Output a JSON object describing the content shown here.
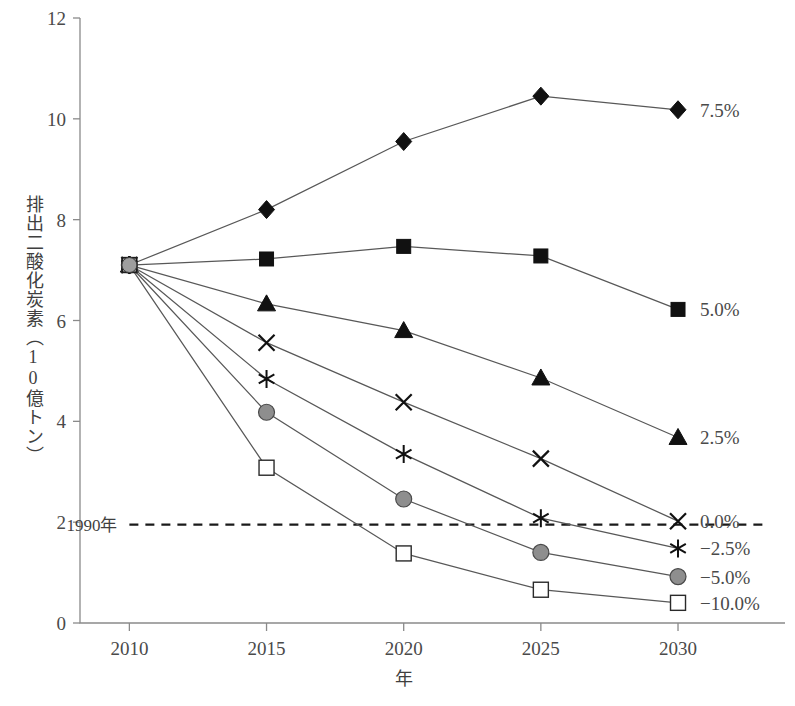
{
  "chart_data": {
    "type": "line",
    "title": "",
    "xlabel": "年",
    "ylabel": "排出二酸化炭素（10億トン）",
    "x": [
      2010,
      2015,
      2020,
      2025,
      2030
    ],
    "xticklabels": [
      "2010",
      "2015",
      "2020",
      "2025",
      "2030"
    ],
    "xlim": [
      2008.2,
      2033.9
    ],
    "ylim": [
      0,
      12
    ],
    "yticks": [
      0,
      2,
      4,
      6,
      8,
      10,
      12
    ],
    "yticklabels": [
      "0",
      "2",
      "4",
      "6",
      "8",
      "10",
      "12"
    ],
    "grid": false,
    "legend_position": "right-of-endpoints",
    "series": [
      {
        "name": "7.5%",
        "label": "7.5%",
        "marker": "filled-diamond",
        "marker_color": "#111111",
        "values": [
          7.1,
          8.2,
          9.55,
          10.45,
          10.18
        ]
      },
      {
        "name": "5.0%",
        "label": "5.0%",
        "marker": "filled-square",
        "marker_color": "#111111",
        "values": [
          7.1,
          7.22,
          7.47,
          7.28,
          6.22
        ]
      },
      {
        "name": "2.5%",
        "label": "2.5%",
        "marker": "filled-triangle",
        "marker_color": "#111111",
        "values": [
          7.1,
          6.33,
          5.8,
          4.86,
          3.68
        ]
      },
      {
        "name": "0.0%",
        "label": "0.0%",
        "marker": "cross-x",
        "marker_color": "#111111",
        "values": [
          7.1,
          5.56,
          4.38,
          3.26,
          2.02
        ]
      },
      {
        "name": "-2.5%",
        "label": "−2.5%",
        "marker": "asterisk",
        "marker_color": "#111111",
        "values": [
          7.1,
          4.84,
          3.35,
          2.08,
          1.48
        ]
      },
      {
        "name": "-5.0%",
        "label": "−5.0%",
        "marker": "filled-circle",
        "marker_color": "#8e8e8e",
        "values": [
          7.1,
          4.18,
          2.46,
          1.4,
          0.92
        ]
      },
      {
        "name": "-10.0%",
        "label": "−10.0%",
        "marker": "open-square",
        "marker_color": "#ffffff",
        "values": [
          7.1,
          3.08,
          1.38,
          0.66,
          0.4
        ]
      }
    ],
    "annotations": [
      {
        "name": "1990-reference",
        "label": "1990年",
        "type": "horizontal-dashed-line",
        "value": 1.95,
        "x_start": 2010,
        "x_end": 2033.2
      }
    ]
  }
}
